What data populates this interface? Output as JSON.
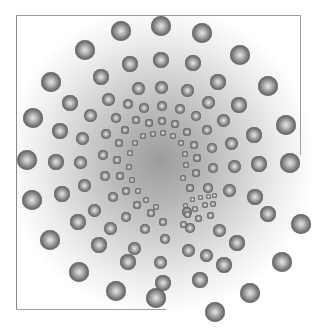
{
  "image": {
    "description": "Spiral pattern of shaded spheres over a radial grey gradient inside a partial square frame",
    "colors": {
      "frame": "#9a9a9a",
      "gradient_center": "#9c9c9c",
      "gradient_edge": "#ffffff",
      "sphere_dark": "#3e3e3e",
      "sphere_light": "#e8e8e8"
    },
    "spheres": [
      [
        121,
        31,
        10
      ],
      [
        161,
        26,
        10
      ],
      [
        202,
        33,
        10
      ],
      [
        240,
        55,
        10
      ],
      [
        268,
        86,
        10
      ],
      [
        286,
        125,
        10
      ],
      [
        290,
        163,
        10
      ],
      [
        301,
        224,
        10
      ],
      [
        282,
        262,
        10
      ],
      [
        250,
        293,
        10
      ],
      [
        215,
        312,
        10
      ],
      [
        156,
        298,
        10
      ],
      [
        116,
        291,
        10
      ],
      [
        79,
        272,
        10
      ],
      [
        50,
        240,
        10
      ],
      [
        32,
        200,
        10
      ],
      [
        27,
        160,
        10
      ],
      [
        33,
        118,
        10
      ],
      [
        51,
        82,
        10
      ],
      [
        85,
        50,
        10
      ],
      [
        130,
        64,
        8
      ],
      [
        161,
        60,
        8
      ],
      [
        193,
        63,
        8
      ],
      [
        218,
        82,
        8
      ],
      [
        239,
        105,
        8
      ],
      [
        254,
        135,
        8
      ],
      [
        259,
        164,
        8
      ],
      [
        255,
        197,
        8
      ],
      [
        268,
        214,
        8
      ],
      [
        237,
        243,
        8
      ],
      [
        224,
        265,
        8
      ],
      [
        200,
        280,
        8
      ],
      [
        163,
        283,
        8
      ],
      [
        128,
        262,
        8
      ],
      [
        99,
        245,
        8
      ],
      [
        78,
        222,
        8
      ],
      [
        62,
        194,
        8
      ],
      [
        56,
        162,
        8
      ],
      [
        60,
        131,
        8
      ],
      [
        70,
        103,
        8
      ],
      [
        101,
        77,
        8
      ],
      [
        138,
        88,
        6.5
      ],
      [
        161,
        87,
        6.5
      ],
      [
        187,
        90,
        6.5
      ],
      [
        208,
        102,
        6.5
      ],
      [
        223,
        120,
        6.5
      ],
      [
        231,
        143,
        6.5
      ],
      [
        234,
        166,
        6.5
      ],
      [
        229,
        190,
        6.5
      ],
      [
        219,
        230,
        6.5
      ],
      [
        206,
        255,
        6.5
      ],
      [
        188,
        250,
        6.5
      ],
      [
        160,
        262,
        6.5
      ],
      [
        134,
        248,
        6.5
      ],
      [
        110,
        228,
        6.5
      ],
      [
        94,
        210,
        6.5
      ],
      [
        84,
        185,
        6.5
      ],
      [
        80,
        162,
        6.5
      ],
      [
        82,
        138,
        6.5
      ],
      [
        90,
        115,
        6.5
      ],
      [
        108,
        99,
        6.5
      ],
      [
        144,
        108,
        5
      ],
      [
        162,
        106,
        5
      ],
      [
        180,
        109,
        5
      ],
      [
        196,
        116,
        5
      ],
      [
        207,
        130,
        5
      ],
      [
        212,
        148,
        5
      ],
      [
        213,
        168,
        5
      ],
      [
        208,
        188,
        5
      ],
      [
        190,
        228,
        5
      ],
      [
        187,
        212,
        5
      ],
      [
        165,
        239,
        5
      ],
      [
        145,
        229,
        5
      ],
      [
        126,
        217,
        5
      ],
      [
        113,
        197,
        5
      ],
      [
        105,
        176,
        5
      ],
      [
        103,
        155,
        5
      ],
      [
        106,
        134,
        5
      ],
      [
        116,
        118,
        5
      ],
      [
        128,
        104,
        5
      ],
      [
        149,
        123,
        4
      ],
      [
        162,
        121,
        4
      ],
      [
        175,
        124,
        4
      ],
      [
        187,
        132,
        4
      ],
      [
        194,
        145,
        4
      ],
      [
        197,
        158,
        4
      ],
      [
        196,
        173,
        4
      ],
      [
        190,
        188,
        4
      ],
      [
        163,
        222,
        4
      ],
      [
        151,
        213,
        4
      ],
      [
        137,
        205,
        4
      ],
      [
        126,
        191,
        4
      ],
      [
        120,
        176,
        4
      ],
      [
        117,
        160,
        4
      ],
      [
        119,
        143,
        4
      ],
      [
        125,
        130,
        4
      ],
      [
        136,
        120,
        4
      ],
      [
        153,
        134,
        3
      ],
      [
        163,
        133,
        3
      ],
      [
        173,
        136,
        3
      ],
      [
        181,
        143,
        3
      ],
      [
        185,
        154,
        3
      ],
      [
        186,
        165,
        3
      ],
      [
        183,
        178,
        3
      ],
      [
        156,
        207,
        3
      ],
      [
        146,
        200,
        3
      ],
      [
        138,
        191,
        3
      ],
      [
        132,
        180,
        3
      ],
      [
        129,
        167,
        3
      ],
      [
        130,
        153,
        3
      ],
      [
        135,
        143,
        3
      ],
      [
        143,
        136,
        3
      ],
      [
        192,
        199,
        2.5
      ],
      [
        200,
        197,
        2.5
      ],
      [
        208,
        196,
        2.5
      ],
      [
        214,
        195,
        2.5
      ],
      [
        185,
        205,
        2.5
      ],
      [
        195,
        209,
        3
      ],
      [
        205,
        205,
        3
      ],
      [
        213,
        204,
        3
      ],
      [
        187,
        214,
        3.5
      ],
      [
        198,
        218,
        3.5
      ],
      [
        183,
        224,
        3.5
      ],
      [
        210,
        215,
        3.5
      ]
    ]
  }
}
